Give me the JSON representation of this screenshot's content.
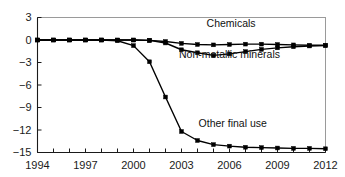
{
  "chart_data": {
    "type": "line",
    "title": "",
    "subtitle": "",
    "xlabel": "",
    "ylabel": "",
    "xlim": [
      1994,
      2012
    ],
    "ylim": [
      -15,
      3
    ],
    "grid": false,
    "legend_position": "inline-annotations",
    "x": [
      1994,
      1995,
      1996,
      1997,
      1998,
      1999,
      2000,
      2001,
      2002,
      2003,
      2004,
      2005,
      2006,
      2007,
      2008,
      2009,
      2010,
      2011,
      2012
    ],
    "x_tick_labels": [
      "1994",
      "1997",
      "2000",
      "2003",
      "2006",
      "2009",
      "2012"
    ],
    "x_tick_values": [
      1994,
      1997,
      2000,
      2003,
      2006,
      2009,
      2012
    ],
    "y_tick_labels": [
      "3",
      "0",
      "-3",
      "-6",
      "-9",
      "-12",
      "-15"
    ],
    "y_tick_values": [
      3,
      0,
      -3,
      -6,
      -9,
      -12,
      -15
    ],
    "series": [
      {
        "name": "Chemicals",
        "marker": "square",
        "color": "#000000",
        "label_x": 2006.1,
        "label_y": 1.75,
        "values": [
          0,
          0,
          0,
          0,
          0,
          0,
          0,
          -0.05,
          -0.2,
          -0.45,
          -0.6,
          -0.65,
          -0.6,
          -0.55,
          -0.55,
          -0.6,
          -0.65,
          -0.7,
          -0.7
        ]
      },
      {
        "name": "Non-metallic minerals",
        "marker": "square",
        "color": "#000000",
        "label_x": 2006.0,
        "label_y": -2.45,
        "values": [
          0,
          0,
          0,
          0,
          0,
          0,
          0,
          -0.05,
          -0.4,
          -1.3,
          -1.7,
          -2.05,
          -1.85,
          -1.55,
          -1.25,
          -1.05,
          -0.9,
          -0.8,
          -0.75
        ]
      },
      {
        "name": "Other final use",
        "marker": "square",
        "color": "#000000",
        "label_x": 2006.2,
        "label_y": -11.6,
        "values": [
          0,
          0,
          0,
          0,
          0,
          -0.1,
          -0.75,
          -2.9,
          -7.6,
          -12.2,
          -13.4,
          -13.95,
          -14.15,
          -14.3,
          -14.35,
          -14.4,
          -14.45,
          -14.45,
          -14.5
        ]
      }
    ]
  }
}
